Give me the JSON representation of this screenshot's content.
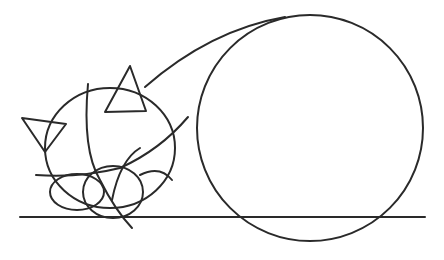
{
  "drawing": {
    "subject": "cat-line-drawing",
    "stroke_color": "#2a2a2a",
    "background": "#ffffff"
  }
}
